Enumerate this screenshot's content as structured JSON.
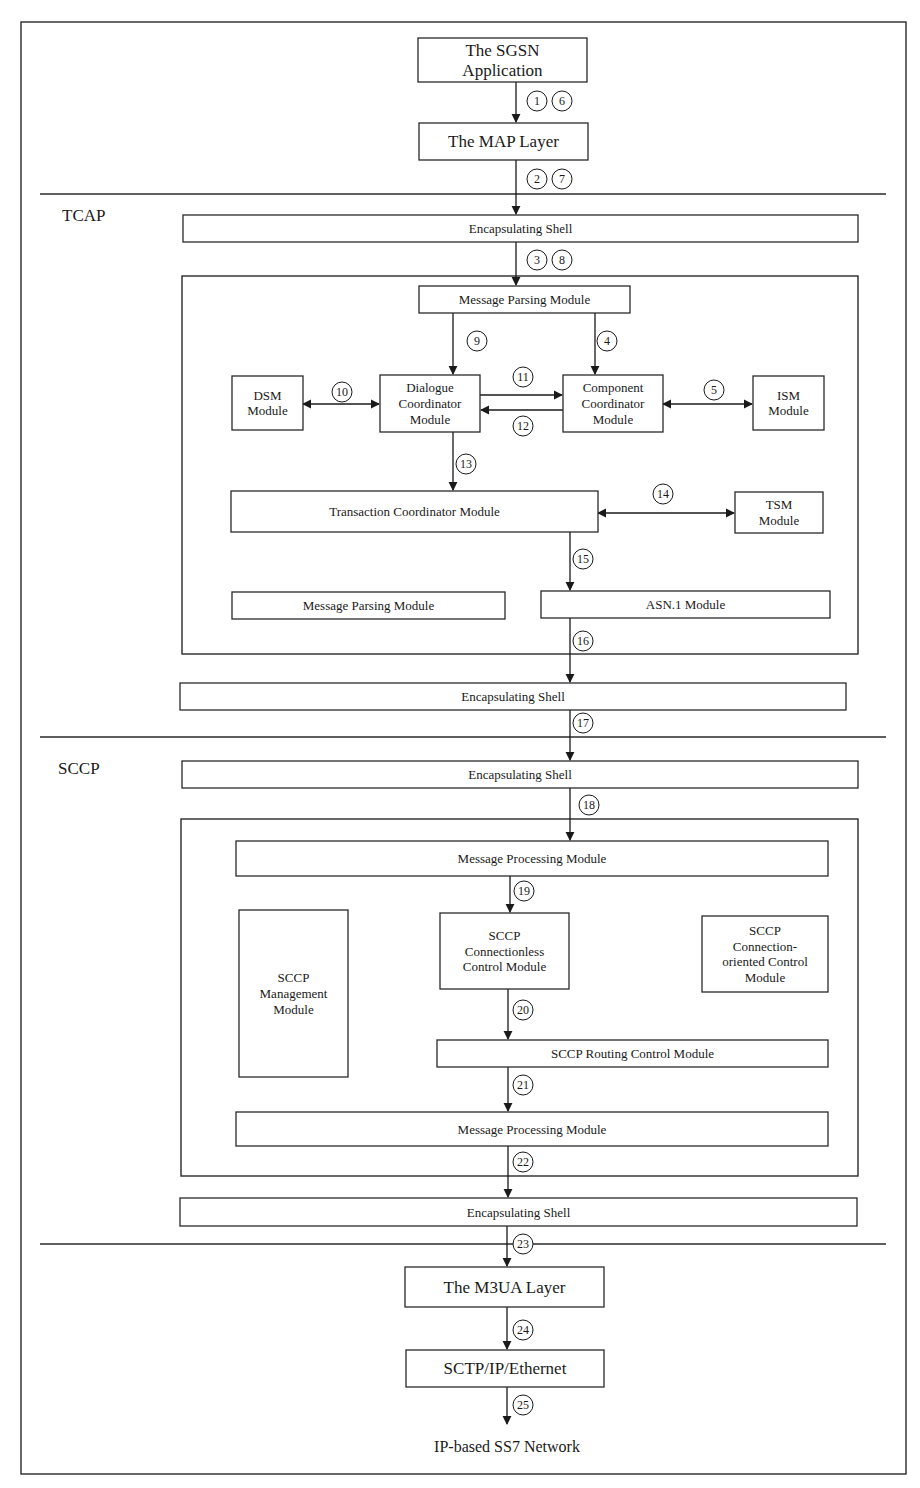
{
  "sections": {
    "tcap": "TCAP",
    "sccp": "SCCP"
  },
  "boxes": {
    "sgsn": [
      "The SGSN",
      "Application"
    ],
    "map": [
      "The MAP Layer"
    ],
    "tcap_shell_top": [
      "Encapsulating Shell"
    ],
    "tcap_msg_parsing_top": [
      "Message Parsing Module"
    ],
    "dsm": [
      "DSM",
      "Module"
    ],
    "dialogue": [
      "Dialogue",
      "Coordinator",
      "Module"
    ],
    "component": [
      "Component",
      "Coordinator",
      "Module"
    ],
    "ism": [
      "ISM",
      "Module"
    ],
    "transaction": [
      "Transaction Coordinator Module"
    ],
    "tsm": [
      "TSM",
      "Module"
    ],
    "tcap_msg_parsing_bottom": [
      "Message Parsing Module"
    ],
    "asn1": [
      "ASN.1 Module"
    ],
    "tcap_shell_bottom": [
      "Encapsulating Shell"
    ],
    "sccp_shell_top": [
      "Encapsulating Shell"
    ],
    "sccp_msg_proc_top": [
      "Message Processing Module"
    ],
    "sccp_mgmt": [
      "SCCP",
      "Management",
      "Module"
    ],
    "sccp_connless": [
      "SCCP",
      "Connectionless",
      "Control Module"
    ],
    "sccp_connoriented": [
      "SCCP",
      "Connection-",
      "oriented Control",
      "Module"
    ],
    "sccp_routing": [
      "SCCP Routing Control Module"
    ],
    "sccp_msg_proc_bottom": [
      "Message Processing Module"
    ],
    "sccp_shell_bottom": [
      "Encapsulating Shell"
    ],
    "m3ua": [
      "The M3UA Layer"
    ],
    "sctp": [
      "SCTP/IP/Ethernet"
    ]
  },
  "terminal_label": "IP-based SS7 Network",
  "steps": {
    "s1": "1",
    "s2": "2",
    "s3": "3",
    "s4": "4",
    "s5": "5",
    "s6": "6",
    "s7": "7",
    "s8": "8",
    "s9": "9",
    "s10": "10",
    "s11": "11",
    "s12": "12",
    "s13": "13",
    "s14": "14",
    "s15": "15",
    "s16": "16",
    "s17": "17",
    "s18": "18",
    "s19": "19",
    "s20": "20",
    "s21": "21",
    "s22": "22",
    "s23": "23",
    "s24": "24",
    "s25": "25"
  },
  "edges": [
    {
      "from": "sgsn",
      "to": "map",
      "steps": [
        "s1",
        "s6"
      ],
      "direction": "one-way"
    },
    {
      "from": "map",
      "to": "tcap_shell_top",
      "steps": [
        "s2",
        "s7"
      ],
      "direction": "one-way"
    },
    {
      "from": "tcap_shell_top",
      "to": "tcap_msg_parsing_top",
      "steps": [
        "s3",
        "s8"
      ],
      "direction": "one-way"
    },
    {
      "from": "tcap_msg_parsing_top",
      "to": "component",
      "steps": [
        "s4"
      ],
      "direction": "one-way"
    },
    {
      "from": "component",
      "to": "ism",
      "steps": [
        "s5"
      ],
      "direction": "two-way"
    },
    {
      "from": "tcap_msg_parsing_top",
      "to": "dialogue",
      "steps": [
        "s9"
      ],
      "direction": "one-way"
    },
    {
      "from": "dsm",
      "to": "dialogue",
      "steps": [
        "s10"
      ],
      "direction": "two-way"
    },
    {
      "from": "dialogue",
      "to": "component",
      "steps": [
        "s11"
      ],
      "direction": "one-way"
    },
    {
      "from": "component",
      "to": "dialogue",
      "steps": [
        "s12"
      ],
      "direction": "one-way"
    },
    {
      "from": "dialogue",
      "to": "transaction",
      "steps": [
        "s13"
      ],
      "direction": "one-way"
    },
    {
      "from": "transaction",
      "to": "tsm",
      "steps": [
        "s14"
      ],
      "direction": "two-way"
    },
    {
      "from": "transaction",
      "to": "asn1",
      "steps": [
        "s15"
      ],
      "direction": "one-way"
    },
    {
      "from": "asn1",
      "to": "tcap_shell_bottom",
      "steps": [
        "s16"
      ],
      "direction": "one-way"
    },
    {
      "from": "tcap_shell_bottom",
      "to": "sccp_shell_top",
      "steps": [
        "s17"
      ],
      "direction": "one-way"
    },
    {
      "from": "sccp_shell_top",
      "to": "sccp_msg_proc_top",
      "steps": [
        "s18"
      ],
      "direction": "one-way"
    },
    {
      "from": "sccp_msg_proc_top",
      "to": "sccp_connless",
      "steps": [
        "s19"
      ],
      "direction": "one-way"
    },
    {
      "from": "sccp_connless",
      "to": "sccp_routing",
      "steps": [
        "s20"
      ],
      "direction": "one-way"
    },
    {
      "from": "sccp_routing",
      "to": "sccp_msg_proc_bottom",
      "steps": [
        "s21"
      ],
      "direction": "one-way"
    },
    {
      "from": "sccp_msg_proc_bottom",
      "to": "sccp_shell_bottom",
      "steps": [
        "s22"
      ],
      "direction": "one-way"
    },
    {
      "from": "sccp_shell_bottom",
      "to": "m3ua",
      "steps": [
        "s23"
      ],
      "direction": "one-way"
    },
    {
      "from": "m3ua",
      "to": "sctp",
      "steps": [
        "s24"
      ],
      "direction": "one-way"
    },
    {
      "from": "sctp",
      "to": "terminal",
      "steps": [
        "s25"
      ],
      "direction": "one-way"
    }
  ]
}
